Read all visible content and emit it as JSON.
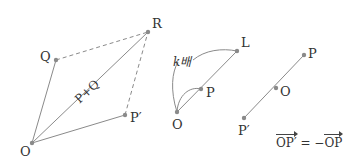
{
  "colors": {
    "line": "#8a8a8a",
    "dashed": "#8a8a8a",
    "point": "#8a8a8a",
    "text": "#333333",
    "background": "#ffffff"
  },
  "figure_addition": {
    "labels": {
      "O": "O",
      "Q": "Q",
      "R": "R",
      "P": "P′",
      "diagonal": "P+Q"
    },
    "points": {
      "O": [
        32,
        143
      ],
      "Q": [
        56,
        60
      ],
      "R": [
        148,
        32
      ],
      "P": [
        125,
        115
      ]
    }
  },
  "figure_scalar": {
    "labels": {
      "O": "O",
      "P": "P",
      "L": "L",
      "scale": "k배"
    },
    "points": {
      "O": [
        177,
        112
      ],
      "P": [
        201,
        89
      ],
      "L": [
        237,
        51
      ]
    }
  },
  "figure_negation": {
    "labels": {
      "P": "P",
      "O": "O",
      "Pprime": "P′"
    },
    "points": {
      "P": [
        304,
        55
      ],
      "O": [
        276,
        88
      ],
      "Pprime": [
        244,
        118
      ]
    },
    "formula": {
      "lhs": "OP′",
      "eq": " = −",
      "rhs": "OP"
    }
  }
}
